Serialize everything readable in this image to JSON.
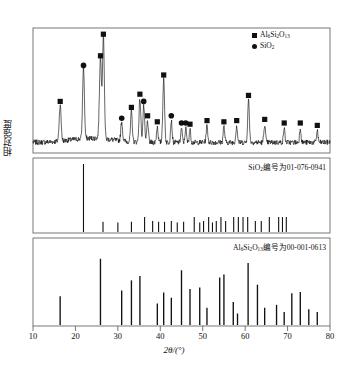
{
  "figure": {
    "axis": {
      "xlabel": "2θ/(°)",
      "ylabel": "相对强度",
      "xmin": 10,
      "xmax": 80,
      "xticks": [
        10,
        20,
        30,
        40,
        50,
        60,
        70,
        80
      ],
      "xtick_labels": [
        "10",
        "20",
        "30",
        "40",
        "50",
        "60",
        "70",
        "80"
      ],
      "grid": false
    },
    "legend": {
      "position": "top-right",
      "entries": [
        {
          "marker": "square-marker",
          "label": "Al₆Si₂O₁₃",
          "color": "#111111"
        },
        {
          "marker": "circle-marker",
          "label": "SiO₂",
          "color": "#111111"
        }
      ]
    },
    "panels": [
      {
        "id": "measured-pattern",
        "note": ""
      },
      {
        "id": "sio2-reference",
        "note": "SiO₂编号为01-076-0941"
      },
      {
        "id": "mullite-reference",
        "note": "Al₆Si₂O₁₃编号为00-001-0613"
      }
    ]
  },
  "chart_data": [
    {
      "type": "line",
      "id": "measured-xrd-pattern",
      "title": "",
      "xlabel": "2θ/(°)",
      "ylabel": "相对强度",
      "xlim": [
        10,
        80
      ],
      "ylim": [
        0,
        100
      ],
      "grid": false,
      "baseline": 8,
      "noise_amplitude": 2.2,
      "peaks": [
        {
          "x": 16.4,
          "height": 30,
          "width": 0.32,
          "marker": "square",
          "phase": "Al6Si2O13"
        },
        {
          "x": 21.9,
          "height": 60,
          "width": 0.3,
          "marker": "circle",
          "phase": "SiO2"
        },
        {
          "x": 25.9,
          "height": 68,
          "width": 0.34,
          "marker": "square",
          "phase": "Al6Si2O13"
        },
        {
          "x": 26.6,
          "height": 86,
          "width": 0.3,
          "marker": "square",
          "phase": "Al6Si2O13"
        },
        {
          "x": 30.9,
          "height": 16,
          "width": 0.28,
          "marker": "circle",
          "phase": "SiO2"
        },
        {
          "x": 33.2,
          "height": 25,
          "width": 0.28,
          "marker": "square",
          "phase": "Al6Si2O13"
        },
        {
          "x": 35.2,
          "height": 36,
          "width": 0.3,
          "marker": "square",
          "phase": "Al6Si2O13"
        },
        {
          "x": 36.1,
          "height": 30,
          "width": 0.28,
          "marker": "circle",
          "phase": "SiO2"
        },
        {
          "x": 37.0,
          "height": 18,
          "width": 0.26,
          "marker": "square",
          "phase": "Al6Si2O13"
        },
        {
          "x": 39.3,
          "height": 13,
          "width": 0.26,
          "marker": "square",
          "phase": "Al6Si2O13"
        },
        {
          "x": 40.8,
          "height": 52,
          "width": 0.3,
          "marker": "square",
          "phase": "Al6Si2O13"
        },
        {
          "x": 42.6,
          "height": 18,
          "width": 0.26,
          "marker": "circle",
          "phase": "SiO2"
        },
        {
          "x": 45.0,
          "height": 12,
          "width": 0.24,
          "marker": "circle",
          "phase": "SiO2"
        },
        {
          "x": 46.0,
          "height": 12,
          "width": 0.24,
          "marker": "circle",
          "phase": "SiO2"
        },
        {
          "x": 47.0,
          "height": 11,
          "width": 0.24,
          "marker": "square",
          "phase": "Al6Si2O13"
        },
        {
          "x": 51.0,
          "height": 14,
          "width": 0.26,
          "marker": "square",
          "phase": "Al6Si2O13"
        },
        {
          "x": 55.0,
          "height": 13,
          "width": 0.26,
          "marker": "square",
          "phase": "Al6Si2O13"
        },
        {
          "x": 58.0,
          "height": 14,
          "width": 0.26,
          "marker": "square",
          "phase": "Al6Si2O13"
        },
        {
          "x": 60.8,
          "height": 35,
          "width": 0.28,
          "marker": "square",
          "phase": "Al6Si2O13"
        },
        {
          "x": 64.6,
          "height": 15,
          "width": 0.26,
          "marker": "square",
          "phase": "Al6Si2O13"
        },
        {
          "x": 69.2,
          "height": 12,
          "width": 0.24,
          "marker": "square",
          "phase": "Al6Si2O13"
        },
        {
          "x": 73.0,
          "height": 12,
          "width": 0.24,
          "marker": "square",
          "phase": "Al6Si2O13"
        },
        {
          "x": 77.0,
          "height": 10,
          "width": 0.24,
          "marker": "square",
          "phase": "Al6Si2O13"
        }
      ]
    },
    {
      "type": "bar",
      "id": "sio2-stick-pattern",
      "title": "SiO₂编号为01-076-0941",
      "xlabel": "2θ/(°)",
      "xlim": [
        10,
        80
      ],
      "ylim": [
        0,
        100
      ],
      "grid": false,
      "x": [
        21.9,
        26.5,
        30.0,
        33.2,
        36.3,
        38.2,
        39.6,
        41.0,
        42.6,
        44.0,
        45.5,
        48.0,
        49.3,
        50.2,
        51.4,
        52.3,
        53.2,
        54.3,
        55.4,
        57.3,
        58.4,
        59.5,
        60.6,
        62.4,
        63.8,
        65.7,
        67.9,
        68.8,
        69.7
      ],
      "values": [
        100,
        15,
        14,
        15,
        22,
        16,
        15,
        15,
        16,
        14,
        15,
        22,
        14,
        16,
        22,
        14,
        16,
        22,
        16,
        22,
        22,
        22,
        22,
        16,
        16,
        22,
        22,
        22,
        22
      ]
    },
    {
      "type": "bar",
      "id": "mullite-stick-pattern",
      "title": "Al₆Si₂O₁₃编号为00-001-0613",
      "xlabel": "2θ/(°)",
      "xlim": [
        10,
        80
      ],
      "ylim": [
        0,
        100
      ],
      "grid": false,
      "x": [
        16.4,
        25.9,
        30.9,
        33.2,
        35.2,
        39.3,
        40.8,
        42.6,
        45.0,
        47.0,
        49.3,
        51.0,
        54.0,
        55.0,
        57.2,
        58.2,
        60.7,
        62.9,
        64.6,
        67.4,
        69.2,
        71.0,
        73.0,
        75.0,
        77.0
      ],
      "values": [
        40,
        92,
        48,
        62,
        68,
        30,
        45,
        38,
        76,
        50,
        52,
        24,
        66,
        70,
        32,
        16,
        86,
        56,
        24,
        28,
        18,
        44,
        46,
        22,
        18
      ]
    }
  ]
}
